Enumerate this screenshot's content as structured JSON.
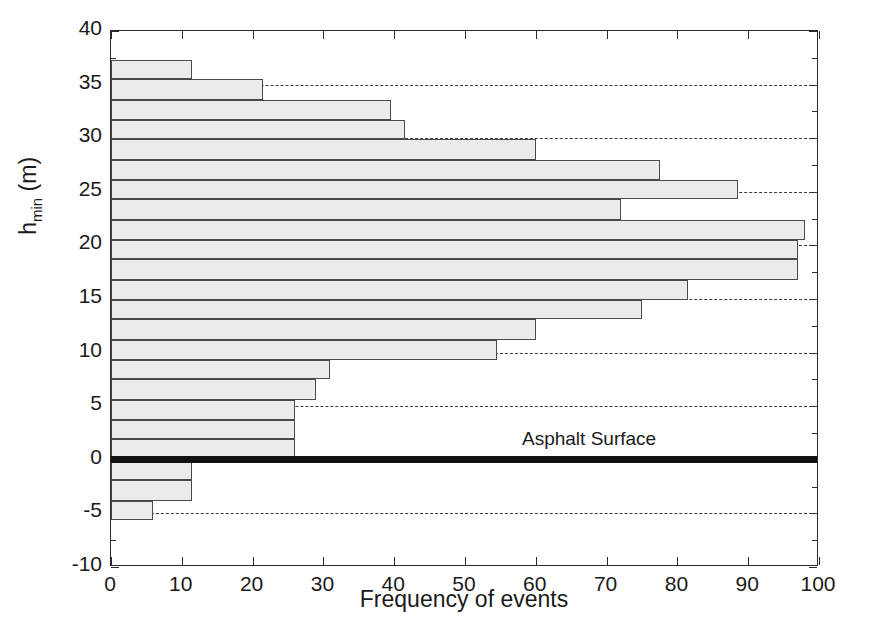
{
  "chart_data": {
    "type": "bar",
    "orientation": "horizontal",
    "title": "",
    "xlabel": "Frequency of events",
    "ylabel": "h_min (m)",
    "ylabel_base": "h",
    "ylabel_sub": "min",
    "ylabel_unit": " (m)",
    "xlim": [
      0,
      100
    ],
    "ylim": [
      -10,
      40
    ],
    "xticks": [
      0,
      10,
      20,
      30,
      40,
      50,
      60,
      70,
      80,
      90,
      100
    ],
    "yticks": [
      -10,
      -5,
      0,
      5,
      10,
      15,
      20,
      25,
      30,
      35,
      40
    ],
    "grid": "horizontal dashed at y = -5, 5, 10, 15, 20, 25, 30, 35",
    "gridlines": [
      -5,
      5,
      10,
      15,
      20,
      25,
      30,
      35
    ],
    "bin_edges": [
      -5.6,
      -3.8,
      -1.9,
      0.0,
      1.9,
      3.7,
      5.6,
      7.5,
      9.3,
      11.2,
      13.1,
      14.9,
      16.8,
      18.7,
      20.5,
      22.4,
      24.3,
      26.1,
      28.0,
      29.9,
      31.7,
      33.6,
      35.5,
      37.3
    ],
    "bin_centers": [
      -4.7,
      -2.9,
      -1.0,
      0.9,
      2.8,
      4.7,
      6.5,
      8.4,
      10.3,
      12.1,
      14.0,
      15.9,
      17.7,
      19.6,
      21.5,
      23.3,
      25.2,
      27.1,
      28.9,
      30.8,
      32.7,
      34.5,
      36.4
    ],
    "values": [
      6,
      11.5,
      11.5,
      26,
      29,
      31,
      54.5,
      60,
      75,
      81.5,
      97,
      98,
      72,
      88.5,
      77.5,
      60,
      41.5,
      39.5,
      21.5,
      11.5
    ],
    "bars": [
      {
        "y_bottom": 35.5,
        "y_top": 37.3,
        "value": 11.5
      },
      {
        "y_bottom": 33.6,
        "y_top": 35.5,
        "value": 21.5
      },
      {
        "y_bottom": 31.7,
        "y_top": 33.6,
        "value": 39.5
      },
      {
        "y_bottom": 29.9,
        "y_top": 31.7,
        "value": 41.5
      },
      {
        "y_bottom": 28.0,
        "y_top": 29.9,
        "value": 60.0
      },
      {
        "y_bottom": 26.1,
        "y_top": 28.0,
        "value": 77.5
      },
      {
        "y_bottom": 24.3,
        "y_top": 26.1,
        "value": 88.5
      },
      {
        "y_bottom": 22.4,
        "y_top": 24.3,
        "value": 72.0
      },
      {
        "y_bottom": 20.5,
        "y_top": 22.4,
        "value": 98.0
      },
      {
        "y_bottom": 18.7,
        "y_top": 20.5,
        "value": 97.0
      },
      {
        "y_bottom": 16.8,
        "y_top": 18.7,
        "value": 97.0
      },
      {
        "y_bottom": 14.9,
        "y_top": 16.8,
        "value": 81.5
      },
      {
        "y_bottom": 13.1,
        "y_top": 14.9,
        "value": 75.0
      },
      {
        "y_bottom": 11.2,
        "y_top": 13.1,
        "value": 60.0
      },
      {
        "y_bottom": 9.3,
        "y_top": 11.2,
        "value": 54.5
      },
      {
        "y_bottom": 7.5,
        "y_top": 9.3,
        "value": 31.0
      },
      {
        "y_bottom": 5.6,
        "y_top": 7.5,
        "value": 29.0
      },
      {
        "y_bottom": 3.7,
        "y_top": 5.6,
        "value": 26.0
      },
      {
        "y_bottom": 1.9,
        "y_top": 3.7,
        "value": 26.0
      },
      {
        "y_bottom": 0.0,
        "y_top": 1.9,
        "value": 26.0
      },
      {
        "y_bottom": -1.9,
        "y_top": 0.0,
        "value": 11.5
      },
      {
        "y_bottom": -3.8,
        "y_top": -1.9,
        "value": 11.5
      },
      {
        "y_bottom": -5.6,
        "y_top": -3.8,
        "value": 6.0
      }
    ],
    "annotations": [
      {
        "name": "asphalt-surface",
        "text": "Asphalt Surface",
        "y": 0,
        "x_text": 75
      }
    ],
    "colors": {
      "bar_fill": "#ebebeb",
      "bar_edge": "#4a4a4a",
      "axis": "#2a2a2a",
      "grid": "#3a3a3a",
      "asphalt_line": "#111111",
      "text": "#1a1a1a",
      "background": "#ffffff"
    }
  },
  "axis": {
    "x_title": "Frequency of events",
    "x_ticklabels": [
      "0",
      "10",
      "20",
      "30",
      "40",
      "50",
      "60",
      "70",
      "80",
      "90",
      "100"
    ],
    "y_ticklabels": [
      "40",
      "35",
      "30",
      "25",
      "20",
      "15",
      "10",
      "5",
      "0",
      "-5",
      "-10"
    ],
    "y_title_base": "h",
    "y_title_sub": "min",
    "y_title_unit": " (m)"
  },
  "labels": {
    "asphalt_surface": "Asphalt Surface"
  }
}
